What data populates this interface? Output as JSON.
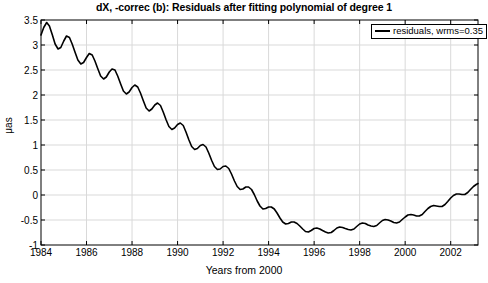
{
  "chart_data": {
    "type": "line",
    "title": "dX, -correc (b): Residuals after fitting polynomial of degree 1",
    "xlabel": "Years from 2000",
    "ylabel": "μas",
    "xlim": [
      1984,
      2003.2
    ],
    "ylim": [
      -1,
      3.5
    ],
    "xticks": [
      1984,
      1986,
      1988,
      1990,
      1992,
      1994,
      1996,
      1998,
      2000,
      2002
    ],
    "xticklabels": [
      "1984",
      "1986",
      "1988",
      "1990",
      "1992",
      "1994",
      "1996",
      "1998",
      "2000",
      "2002"
    ],
    "yticks": [
      -1,
      -0.5,
      0,
      0.5,
      1,
      1.5,
      2,
      2.5,
      3,
      3.5
    ],
    "yticklabels": [
      "-1",
      "-0.5",
      "0",
      "0.5",
      "1",
      "1.5",
      "2",
      "2.5",
      "3",
      "3.5"
    ],
    "grid": true,
    "legend": {
      "position": "top-right",
      "entries": [
        {
          "label": "residuals, wrms=0.35",
          "color": "#000000",
          "style": "line"
        }
      ]
    },
    "series": [
      {
        "name": "residuals, wrms=0.35",
        "color": "#000000",
        "linewidth": 1.6,
        "x": [
          1984.0,
          1984.12,
          1984.25,
          1984.37,
          1984.5,
          1984.62,
          1984.75,
          1984.87,
          1985.0,
          1985.12,
          1985.25,
          1985.37,
          1985.5,
          1985.62,
          1985.75,
          1985.87,
          1986.0,
          1986.12,
          1986.25,
          1986.37,
          1986.5,
          1986.62,
          1986.75,
          1986.87,
          1987.0,
          1987.12,
          1987.25,
          1987.37,
          1987.5,
          1987.62,
          1987.75,
          1987.87,
          1988.0,
          1988.12,
          1988.25,
          1988.37,
          1988.5,
          1988.62,
          1988.75,
          1988.87,
          1989.0,
          1989.12,
          1989.25,
          1989.37,
          1989.5,
          1989.62,
          1989.75,
          1989.87,
          1990.0,
          1990.12,
          1990.25,
          1990.37,
          1990.5,
          1990.62,
          1990.75,
          1990.87,
          1991.0,
          1991.12,
          1991.25,
          1991.37,
          1991.5,
          1991.62,
          1991.75,
          1991.87,
          1992.0,
          1992.12,
          1992.25,
          1992.37,
          1992.5,
          1992.62,
          1992.75,
          1992.87,
          1993.0,
          1993.12,
          1993.25,
          1993.37,
          1993.5,
          1993.62,
          1993.75,
          1993.87,
          1994.0,
          1994.12,
          1994.25,
          1994.37,
          1994.5,
          1994.62,
          1994.75,
          1994.87,
          1995.0,
          1995.12,
          1995.25,
          1995.37,
          1995.5,
          1995.62,
          1995.75,
          1995.87,
          1996.0,
          1996.12,
          1996.25,
          1996.37,
          1996.5,
          1996.62,
          1996.75,
          1996.87,
          1997.0,
          1997.12,
          1997.25,
          1997.37,
          1997.5,
          1997.62,
          1997.75,
          1997.87,
          1998.0,
          1998.12,
          1998.25,
          1998.37,
          1998.5,
          1998.62,
          1998.75,
          1998.87,
          1999.0,
          1999.12,
          1999.25,
          1999.37,
          1999.5,
          1999.62,
          1999.75,
          1999.87,
          2000.0,
          2000.12,
          2000.25,
          2000.37,
          2000.5,
          2000.62,
          2000.75,
          2000.87,
          2001.0,
          2001.12,
          2001.25,
          2001.37,
          2001.5,
          2001.62,
          2001.75,
          2001.87,
          2002.0,
          2002.12,
          2002.25,
          2002.37,
          2002.5,
          2002.62,
          2002.75,
          2002.87,
          2003.0,
          2003.12,
          2003.2
        ],
        "y": [
          3.2,
          3.35,
          3.45,
          3.38,
          3.2,
          3.02,
          2.92,
          2.95,
          3.08,
          3.18,
          3.15,
          3.02,
          2.85,
          2.7,
          2.62,
          2.65,
          2.75,
          2.83,
          2.8,
          2.68,
          2.52,
          2.38,
          2.32,
          2.36,
          2.46,
          2.52,
          2.5,
          2.38,
          2.22,
          2.08,
          2.02,
          2.06,
          2.15,
          2.2,
          2.16,
          2.04,
          1.88,
          1.74,
          1.68,
          1.72,
          1.8,
          1.84,
          1.79,
          1.66,
          1.5,
          1.37,
          1.31,
          1.34,
          1.41,
          1.44,
          1.39,
          1.26,
          1.1,
          0.97,
          0.91,
          0.93,
          0.99,
          1.01,
          0.96,
          0.84,
          0.69,
          0.57,
          0.51,
          0.52,
          0.57,
          0.58,
          0.53,
          0.42,
          0.28,
          0.17,
          0.11,
          0.12,
          0.16,
          0.16,
          0.11,
          0.01,
          -0.12,
          -0.22,
          -0.28,
          -0.27,
          -0.24,
          -0.24,
          -0.28,
          -0.36,
          -0.46,
          -0.54,
          -0.58,
          -0.57,
          -0.54,
          -0.54,
          -0.57,
          -0.62,
          -0.68,
          -0.73,
          -0.74,
          -0.71,
          -0.67,
          -0.66,
          -0.68,
          -0.71,
          -0.74,
          -0.76,
          -0.75,
          -0.71,
          -0.66,
          -0.64,
          -0.65,
          -0.67,
          -0.69,
          -0.7,
          -0.68,
          -0.63,
          -0.58,
          -0.56,
          -0.57,
          -0.6,
          -0.62,
          -0.63,
          -0.61,
          -0.56,
          -0.51,
          -0.49,
          -0.5,
          -0.52,
          -0.55,
          -0.56,
          -0.54,
          -0.49,
          -0.44,
          -0.4,
          -0.39,
          -0.4,
          -0.42,
          -0.42,
          -0.39,
          -0.33,
          -0.27,
          -0.23,
          -0.21,
          -0.22,
          -0.23,
          -0.23,
          -0.19,
          -0.13,
          -0.06,
          -0.01,
          0.02,
          0.02,
          0.01,
          0.01,
          0.05,
          0.11,
          0.17,
          0.21,
          0.23
        ]
      }
    ]
  },
  "axes": {
    "frame_color": "#000000",
    "grid_color": "#d9d9d9",
    "background": "#ffffff"
  }
}
